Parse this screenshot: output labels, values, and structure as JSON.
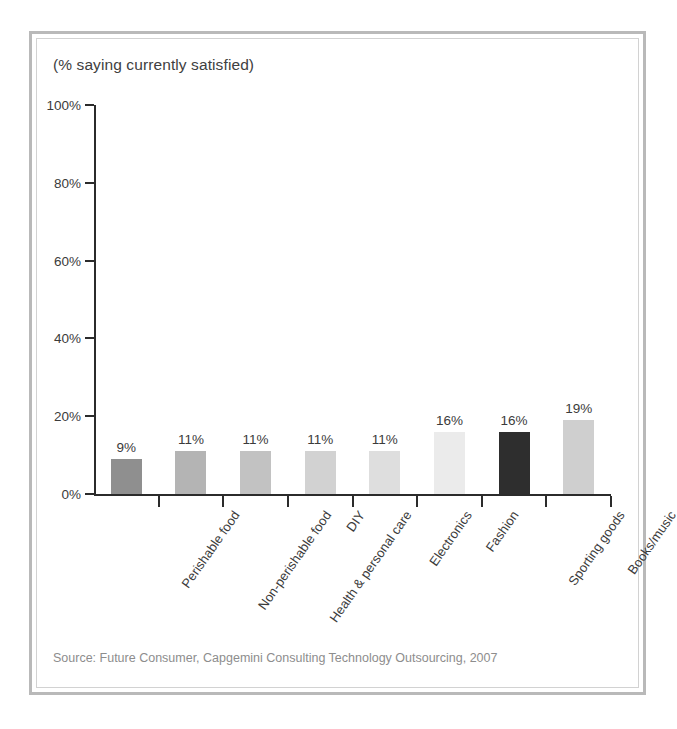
{
  "chart_data": {
    "type": "bar",
    "title": "(% saying currently satisfied)",
    "xlabel": "",
    "ylabel": "",
    "ylim": [
      0,
      100
    ],
    "ytick_labels": [
      "100%",
      "80%",
      "60%",
      "40%",
      "20%",
      "0%"
    ],
    "ytick_values": [
      100,
      80,
      60,
      40,
      20,
      0
    ],
    "grid": false,
    "legend": null,
    "categories": [
      "Perishable food",
      "Non-perishable food",
      "Health & personal care",
      "DIY",
      "Electronics",
      "Fashion",
      "Sporting goods",
      "Books/music"
    ],
    "values": [
      9,
      11,
      11,
      11,
      11,
      16,
      16,
      19
    ],
    "value_labels": [
      "9%",
      "11%",
      "11%",
      "11%",
      "11%",
      "16%",
      "16%",
      "19%"
    ],
    "bar_colors": [
      "#8f8f8f",
      "#b4b4b4",
      "#c2c2c2",
      "#d2d2d2",
      "#dedede",
      "#ebebeb",
      "#2e2e2e",
      "#cfcfcf"
    ],
    "highlighted_category": "Sporting goods",
    "source": "Source: Future Consumer, Capgemini Consulting Technology Outsourcing, 2007"
  },
  "colors": {
    "axis": "#2b2b2b",
    "text": "#3b3b3b",
    "title_text": "#404040",
    "source_text": "#8d8d8d",
    "frame_outer": "#b9b9b9",
    "frame_inner": "#d2d2d2",
    "background": "#ffffff"
  }
}
